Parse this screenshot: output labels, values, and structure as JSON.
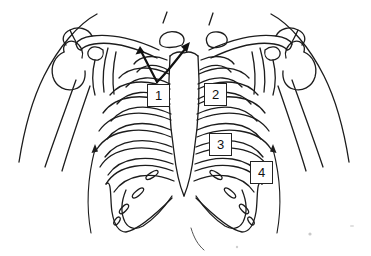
{
  "figure": {
    "type": "anatomical-line-drawing",
    "background_color": "#ffffff",
    "line_color": "#1c1c1c",
    "arrow_color": "#111111"
  },
  "labels": [
    {
      "number": "1"
    },
    {
      "number": "2"
    },
    {
      "number": "3"
    },
    {
      "number": "4"
    }
  ],
  "arrows": {
    "count": 2,
    "style": "curved solid arrows with filled heads"
  }
}
